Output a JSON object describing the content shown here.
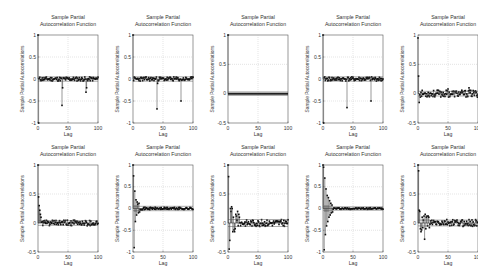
{
  "chart_data": [
    {
      "type": "scatter",
      "subtype": "stem",
      "panel": "row1-col1",
      "title": [
        "Sample Partial",
        "Autocorrelation Function"
      ],
      "xlabel": "Lag",
      "ylabel": "Sample Partial Autocorrelations",
      "xlim": [
        0,
        100
      ],
      "ylim": [
        -1,
        1
      ],
      "xticks": [
        0,
        50,
        100
      ],
      "yticks": [
        -1,
        -0.5,
        0,
        0.5,
        1
      ],
      "yticklabels": [
        "-1",
        "-0.5",
        "0",
        "0.5",
        "1"
      ],
      "grid": true,
      "bounds": [
        0.05,
        -0.05
      ],
      "lags0": [
        1.0,
        -1.0
      ],
      "noise": 0.05,
      "spikes": [
        [
          40,
          -0.6
        ],
        [
          41,
          -0.2
        ],
        [
          80,
          -0.3
        ],
        [
          81,
          -0.2
        ]
      ],
      "seed": 11
    },
    {
      "type": "scatter",
      "subtype": "stem",
      "panel": "row1-col2",
      "title": [
        "Sample Partial",
        "Autocorrelation Function"
      ],
      "xlabel": "Lag",
      "ylabel": "Sample Partial Autocorrelations",
      "xlim": [
        0,
        100
      ],
      "ylim": [
        -1,
        1
      ],
      "xticks": [
        0,
        50,
        100
      ],
      "yticks": [
        -1,
        -0.5,
        0,
        0.5,
        1
      ],
      "yticklabels": [
        "-1",
        "-0.5",
        "0",
        "0.5",
        "1"
      ],
      "grid": true,
      "bounds": [
        0.05,
        -0.05
      ],
      "lags0": [
        1.0
      ],
      "noise": 0.05,
      "spikes": [
        [
          40,
          -0.68
        ],
        [
          41,
          -0.1
        ],
        [
          80,
          -0.5
        ]
      ],
      "seed": 23
    },
    {
      "type": "scatter",
      "subtype": "stem",
      "panel": "row1-col3",
      "title": [
        "Sample Partial",
        "Autocorrelation Function"
      ],
      "xlabel": "Lag",
      "ylabel": "Sample Partial Autocorrelations",
      "xlim": [
        0,
        100
      ],
      "ylim": [
        -0.5,
        1
      ],
      "xticks": [
        0,
        50,
        100
      ],
      "yticks": [
        -0.5,
        0,
        0.5,
        1
      ],
      "yticklabels": [
        "-0.5",
        "0",
        "0.5",
        "1"
      ],
      "grid": true,
      "bounds": [
        0.03,
        -0.03
      ],
      "lags0": [
        1.0
      ],
      "noise": 0.003,
      "spikes": [],
      "thick_zero": true,
      "seed": 37
    },
    {
      "type": "scatter",
      "subtype": "stem",
      "panel": "row1-col4",
      "title": [
        "Sample Partial",
        "Autocorrelation Function"
      ],
      "xlabel": "Lag",
      "ylabel": "Sample Partial Autocorrelations",
      "xlim": [
        0,
        100
      ],
      "ylim": [
        -1,
        1
      ],
      "xticks": [
        0,
        50,
        100
      ],
      "yticks": [
        -1,
        -0.5,
        0,
        0.5,
        1
      ],
      "yticklabels": [
        "-1",
        "-0.5",
        "0",
        "0.5",
        "1"
      ],
      "grid": true,
      "bounds": [
        0.05,
        -0.05
      ],
      "lags0": [
        1.0,
        -1.0
      ],
      "noise": 0.05,
      "spikes": [
        [
          40,
          -0.65
        ],
        [
          80,
          -0.5
        ]
      ],
      "seed": 41
    },
    {
      "type": "scatter",
      "subtype": "stem",
      "panel": "row1-col5",
      "title": [
        "Sample Partial",
        "Autocorrelation Function"
      ],
      "xlabel": "Lag",
      "ylabel": "Sample Partial Autocorrelations",
      "xlim": [
        0,
        100
      ],
      "ylim": [
        -0.5,
        1
      ],
      "xticks": [
        0,
        50,
        100
      ],
      "yticks": [
        -0.5,
        0,
        0.5,
        1
      ],
      "yticklabels": [
        "-0.5",
        "0",
        "0.5",
        "1"
      ],
      "grid": true,
      "bounds": [
        0.04,
        -0.04
      ],
      "lags0": [
        0.95,
        0.3,
        -0.15
      ],
      "noise": 0.06,
      "spikes": [
        [
          50,
          0.08
        ],
        [
          85,
          0.1
        ]
      ],
      "seed": 53
    },
    {
      "type": "scatter",
      "subtype": "stem",
      "panel": "row2-col1",
      "title": [
        "Sample Partial",
        "Autocorrelation Function"
      ],
      "xlabel": "Lag",
      "ylabel": "Sample Partial Autocorrelations",
      "xlim": [
        0,
        100
      ],
      "ylim": [
        -0.5,
        1
      ],
      "xticks": [
        0,
        50,
        100
      ],
      "yticks": [
        -0.5,
        0,
        0.5,
        1
      ],
      "yticklabels": [
        "-0.5",
        "0",
        "0.5",
        "1"
      ],
      "grid": true,
      "bounds": [
        0.04,
        -0.04
      ],
      "lags0": [
        1.0,
        0.45,
        0.3,
        0.22,
        0.15,
        0.1
      ],
      "noise": 0.05,
      "spikes": [],
      "seed": 61
    },
    {
      "type": "scatter",
      "subtype": "stem",
      "panel": "row2-col2",
      "title": [
        "Sample Partial",
        "Autocorrelation Function"
      ],
      "xlabel": "Lag",
      "ylabel": "Sample Partial Autocorrelations",
      "xlim": [
        0,
        100
      ],
      "ylim": [
        -1,
        1
      ],
      "xticks": [
        0,
        50,
        100
      ],
      "yticks": [
        -1,
        -0.5,
        0,
        0.5,
        1
      ],
      "yticklabels": [
        "-1",
        "-0.5",
        "0",
        "0.5",
        "1"
      ],
      "grid": true,
      "bounds": [
        0.05,
        -0.05
      ],
      "lags0": [
        1.0,
        0.75,
        -0.9,
        0.4,
        -0.3,
        0.2,
        -0.15,
        0.15,
        0.1,
        -0.1,
        0.12,
        -0.08
      ],
      "noise": 0.03,
      "spikes": [],
      "shaded_band": true,
      "seed": 71
    },
    {
      "type": "scatter",
      "subtype": "stem",
      "panel": "row2-col3",
      "title": [
        "Sample Partial",
        "Autocorrelation Function"
      ],
      "xlabel": "Lag",
      "ylabel": "Sample Partial Autocorrelations",
      "xlim": [
        0,
        100
      ],
      "ylim": [
        -0.5,
        1
      ],
      "xticks": [
        0,
        50,
        100
      ],
      "yticks": [
        -0.5,
        0,
        0.5,
        1
      ],
      "yticklabels": [
        "-0.5",
        "0",
        "0.5",
        "1"
      ],
      "grid": true,
      "bounds": [
        0.06,
        -0.06
      ],
      "lags0": [
        1.0,
        0.8,
        -0.45,
        -0.3,
        0.25,
        0.2,
        0.28,
        0.25,
        -0.15,
        0.1,
        -0.12,
        -0.15,
        -0.1,
        0.15,
        0.12,
        0.05,
        0.2,
        -0.05,
        0.15,
        0.1
      ],
      "noise": 0.06,
      "spikes": [],
      "seed": 83
    },
    {
      "type": "scatter",
      "subtype": "stem",
      "panel": "row2-col4",
      "title": [
        "Sample Partial",
        "Autocorrelation Function"
      ],
      "xlabel": "Lag",
      "ylabel": "Sample Partial Autocorrelations",
      "xlim": [
        0,
        100
      ],
      "ylim": [
        -1,
        1
      ],
      "xticks": [
        0,
        50,
        100
      ],
      "yticks": [
        -1,
        -0.5,
        0,
        0.5,
        1
      ],
      "yticklabels": [
        "-1",
        "-0.5",
        "0",
        "0.5",
        "1"
      ],
      "grid": true,
      "bounds": [
        0.04,
        -0.04
      ],
      "lags0": [
        1.0,
        0.95,
        -0.95,
        0.7,
        -0.6,
        0.45,
        -0.4,
        0.3,
        -0.3,
        0.25,
        -0.2,
        0.18,
        -0.15,
        0.12,
        -0.1,
        0.08,
        -0.08
      ],
      "noise": 0.02,
      "spikes": [],
      "shaded_band": true,
      "seed": 97
    },
    {
      "type": "scatter",
      "subtype": "stem",
      "panel": "row2-col5",
      "title": [
        "Sample Partial",
        "Autocorrelation Function"
      ],
      "xlabel": "Lag",
      "ylabel": "Sample Partial Autocorrelations",
      "xlim": [
        0,
        100
      ],
      "ylim": [
        -0.5,
        1
      ],
      "xticks": [
        0,
        50,
        100
      ],
      "yticks": [
        -0.5,
        0,
        0.5,
        1
      ],
      "yticklabels": [
        "-0.5",
        "0",
        "0.5",
        "1"
      ],
      "grid": true,
      "bounds": [
        0.05,
        -0.05
      ],
      "lags0": [
        1.0,
        0.9,
        0.22,
        0.2,
        -0.1,
        -0.15,
        -0.12,
        0.1,
        -0.08,
        0.05,
        0.12,
        -0.28,
        0.15,
        -0.1,
        0.1,
        0.12,
        -0.05,
        0.12,
        0.1,
        -0.08
      ],
      "noise": 0.06,
      "spikes": [],
      "seed": 103
    }
  ],
  "layout": {
    "cols_x": [
      18,
      113,
      208,
      303,
      398
    ],
    "rows_y": [
      2,
      132
    ],
    "panel_w": 82,
    "panel_h": 130
  }
}
